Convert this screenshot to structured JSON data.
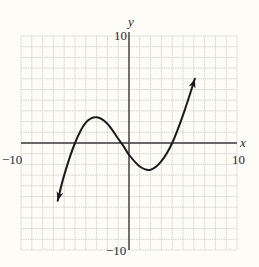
{
  "chart_data": {
    "type": "line",
    "title": "",
    "xlabel": "x",
    "ylabel": "y",
    "xlim": [
      -10,
      10
    ],
    "ylim": [
      -10,
      10
    ],
    "grid": true,
    "grid_step": 1,
    "tick_labels": {
      "x_min": "−10",
      "x_max": "10",
      "y_min": "−10",
      "y_max": "10"
    },
    "series": [
      {
        "name": "f(x)",
        "description": "cubic curve with arrows at both ends",
        "points": [
          [
            -6.6,
            -5.4
          ],
          [
            -6.0,
            -3.0
          ],
          [
            -5.0,
            0.0
          ],
          [
            -4.0,
            1.9
          ],
          [
            -3.0,
            2.4
          ],
          [
            -2.0,
            1.8
          ],
          [
            -1.0,
            0.4
          ],
          [
            -0.5,
            -0.3
          ],
          [
            0.0,
            -1.1
          ],
          [
            1.0,
            -2.2
          ],
          [
            2.0,
            -2.5
          ],
          [
            3.0,
            -1.7
          ],
          [
            4.0,
            0.0
          ],
          [
            5.0,
            2.6
          ],
          [
            6.1,
            6.0
          ]
        ],
        "zeros": [
          -5,
          -1,
          4
        ],
        "local_max": [
          -3,
          2.4
        ],
        "local_min": [
          2,
          -2.5
        ],
        "arrow_start": [
          -6.6,
          -5.4
        ],
        "arrow_end": [
          6.1,
          6.0
        ]
      }
    ]
  },
  "colors": {
    "background": "#fdfcf6",
    "grid": "#c9c9c2",
    "axis": "#3a3a3a",
    "curve": "#1a1a1a",
    "text": "#2a2a2a"
  }
}
